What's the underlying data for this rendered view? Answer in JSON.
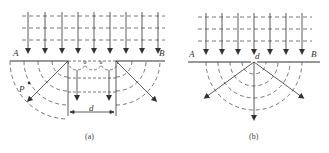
{
  "figure": {
    "colors": {
      "line": "#333333",
      "dashed": "#555555",
      "background": "#ffffff"
    }
  },
  "panel_a": {
    "caption": "(a)",
    "label_left": "A",
    "label_right": "B",
    "point_label": "P",
    "width_label": "d"
  },
  "panel_b": {
    "caption": "(b)",
    "label_left": "A",
    "label_right": "B",
    "slit_label": "d"
  }
}
